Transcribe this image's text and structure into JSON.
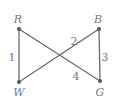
{
  "graph": {
    "nodes": [
      {
        "id": "R",
        "label": "R",
        "x": 19,
        "y": 29,
        "lx": 18,
        "ly": 23
      },
      {
        "id": "B",
        "label": "B",
        "x": 99,
        "y": 29,
        "lx": 98,
        "ly": 23
      },
      {
        "id": "W",
        "label": "W",
        "x": 19,
        "y": 82,
        "lx": 19,
        "ly": 96
      },
      {
        "id": "G",
        "label": "G",
        "x": 100,
        "y": 81,
        "lx": 100,
        "ly": 96
      }
    ],
    "edges": [
      {
        "from": "R",
        "to": "W",
        "label": "1",
        "lx": 12,
        "ly": 61
      },
      {
        "from": "W",
        "to": "B",
        "label": "2",
        "lx": 74,
        "ly": 45
      },
      {
        "from": "B",
        "to": "G",
        "label": "3",
        "lx": 105,
        "ly": 61
      },
      {
        "from": "R",
        "to": "G",
        "label": "4",
        "lx": 76,
        "ly": 80
      }
    ]
  }
}
